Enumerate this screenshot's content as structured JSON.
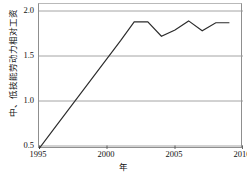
{
  "chart_data": {
    "type": "line",
    "title": "",
    "xlabel": "年",
    "ylabel": "中、低技能劳动力相对工资",
    "xlim": [
      1995,
      2010
    ],
    "ylim": [
      0.4,
      2.05
    ],
    "grid": true,
    "legend": null,
    "xticks": [
      "1995",
      "2000",
      "2005",
      "2010"
    ],
    "xtick_values": [
      1995,
      2000,
      2005,
      2010
    ],
    "yticks": [
      "0.5",
      "1.0",
      "1.5",
      "2.0"
    ],
    "ytick_values": [
      0.5,
      1.0,
      1.5,
      2.0
    ],
    "line_color": "#2b2b2b",
    "grid_color": "#9a9a9a",
    "series": [
      {
        "name": "中、低技能劳动力相对工资",
        "x": [
          1995,
          1996,
          1997,
          1998,
          1999,
          2000,
          2001,
          2002,
          2003,
          2004,
          2005,
          2006,
          2007,
          2008,
          2009
        ],
        "values": [
          0.47,
          0.67,
          0.87,
          1.07,
          1.27,
          1.47,
          1.67,
          1.88,
          1.88,
          1.72,
          1.79,
          1.89,
          1.78,
          1.87,
          1.87
        ]
      }
    ]
  },
  "axes": {
    "y_title": "中、低技能劳动力相对工资",
    "x_title": "年"
  }
}
